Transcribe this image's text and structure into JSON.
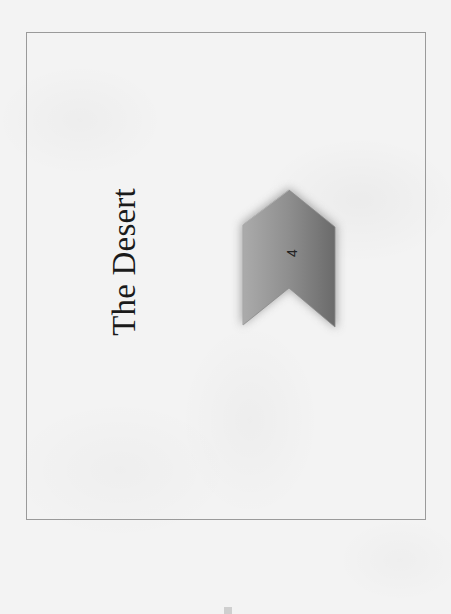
{
  "page": {
    "title": "The Desert",
    "orientation": "rotated-90-ccw",
    "background_color": "#f3f3f3",
    "frame_color": "#9a9a9a"
  },
  "chevron": {
    "label": "4",
    "direction": "up",
    "fill_light": "#a8a8a8",
    "fill_dark": "#6e6e6e",
    "outline_color": "#8a8a8a",
    "glow_color": "#9a9a9a"
  }
}
